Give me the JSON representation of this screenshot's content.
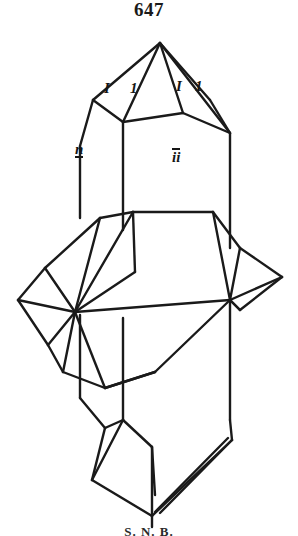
{
  "figure": {
    "number": "647",
    "caption": "S. N. B.",
    "type": "crystallographic-twin-line-drawing",
    "ink_color": "#1a1a1a",
    "background_color": "#ffffff"
  },
  "labels": {
    "pyramid_face_1": "I",
    "pyramid_face_2": "1",
    "pyramid_face_3": "I",
    "pyramid_face_4": "1",
    "prism_face_left": "n",
    "prism_face_right": "ii"
  },
  "geometry": {
    "apex": {
      "x": 160,
      "y": 43
    },
    "main_crystal": "vertical hexagonal prism with terminal pyramids top and bottom",
    "twin_crystal": "inclined prism penetrating the main crystal at mid-height",
    "stroke_width": 2.2
  }
}
